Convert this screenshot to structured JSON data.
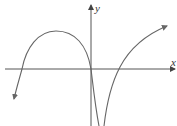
{
  "diagram": {
    "type": "function-graph",
    "axes": {
      "x_label": "x",
      "y_label": "y",
      "color": "#555555"
    },
    "curve_color": "#666666",
    "curves": [
      {
        "name": "left-branch",
        "description": "Comes up from lower-left (arrow), crosses x-axis at negative x, reaches a local maximum, passes through origin, then plunges down toward a vertical asymptote just right of the y-axis"
      },
      {
        "name": "right-branch",
        "description": "Rises from negative infinity just right of the asymptote, crosses positive x-axis, continues increasing toward upper-right (arrow)"
      }
    ]
  }
}
